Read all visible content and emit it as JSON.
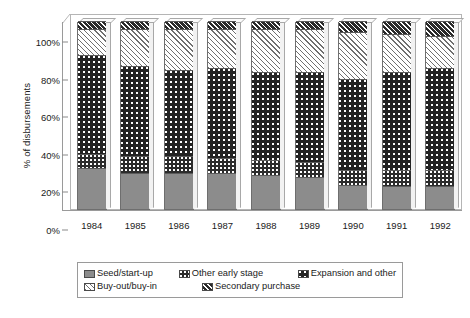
{
  "chart_data": {
    "type": "bar",
    "subtype": "stacked-100-percent-3d",
    "title": "",
    "xlabel": "",
    "ylabel": "% of disbursements",
    "ylim": [
      0,
      100
    ],
    "ytick_labels": [
      "0%",
      "20%",
      "40%",
      "60%",
      "80%",
      "100%"
    ],
    "ytick_values": [
      0,
      20,
      40,
      60,
      80,
      100
    ],
    "grid": false,
    "legend_position": "bottom",
    "categories": [
      "1984",
      "1985",
      "1986",
      "1987",
      "1988",
      "1989",
      "1990",
      "1991",
      "1992"
    ],
    "stack_order_bottom_to_top": [
      "Seed/start-up",
      "Other early stage",
      "Expansion and other",
      "Buy-out/buy-in",
      "Secondary purchase"
    ],
    "series": [
      {
        "name": "Seed/start-up",
        "pattern": "solid-gray",
        "color": "#8c8c8c",
        "values": [
          22,
          19,
          19,
          19,
          18,
          17,
          13,
          12,
          12
        ]
      },
      {
        "name": "Other early stage",
        "pattern": "dark-dotted",
        "color": "#2b2b2b",
        "values": [
          7,
          9,
          9,
          8,
          8,
          8,
          8,
          9,
          9
        ]
      },
      {
        "name": "Expansion and other",
        "pattern": "dark-dotted-large",
        "color": "#232323",
        "values": [
          53,
          48,
          46,
          48,
          47,
          48,
          48,
          52,
          54
        ]
      },
      {
        "name": "Buy-out/buy-in",
        "pattern": "light-diagonal-hatch",
        "color": "#ffffff",
        "values": [
          14,
          20,
          22,
          21,
          23,
          23,
          25,
          20,
          17
        ]
      },
      {
        "name": "Secondary purchase",
        "pattern": "dark-diagonal-hatch",
        "color": "#2a2a2a",
        "values": [
          4,
          4,
          4,
          4,
          4,
          4,
          6,
          7,
          8
        ]
      }
    ]
  },
  "axis": {
    "y_title": "% of disbursements"
  },
  "legend": {
    "items": [
      {
        "label": "Seed/start-up",
        "pattern_class": "p-seed"
      },
      {
        "label": "Other early stage",
        "pattern_class": "p-otherearly"
      },
      {
        "label": "Expansion and other",
        "pattern_class": "p-expansion"
      },
      {
        "label": "Buy-out/buy-in",
        "pattern_class": "p-buyout"
      },
      {
        "label": "Secondary purchase",
        "pattern_class": "p-secondary"
      }
    ],
    "row1_count": 3
  }
}
